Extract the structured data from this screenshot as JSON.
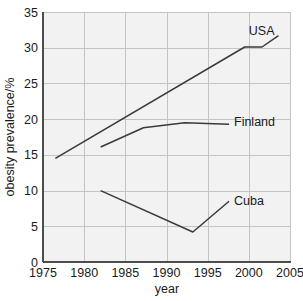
{
  "chart_data": {
    "type": "line",
    "title": "",
    "xlabel": "year",
    "ylabel": "obesity prevalence/%",
    "xlim": [
      1975,
      2005
    ],
    "ylim": [
      0,
      35
    ],
    "xticks": [
      1975,
      1980,
      1985,
      1990,
      1995,
      2000,
      2005
    ],
    "yticks": [
      0,
      5,
      10,
      15,
      20,
      25,
      30,
      35
    ],
    "grid": true,
    "legend_position": "inline-end-of-line",
    "series": [
      {
        "name": "USA",
        "label": "USA",
        "color": "#3a3a3a",
        "points": [
          [
            1976.5,
            14.5
          ],
          [
            1999.5,
            30.1
          ],
          [
            2001.6,
            30.1
          ],
          [
            2003.6,
            31.7
          ]
        ]
      },
      {
        "name": "Finland",
        "label": "Finland",
        "color": "#3a3a3a",
        "points": [
          [
            1982.0,
            16.1
          ],
          [
            1987.2,
            18.8
          ],
          [
            1992.2,
            19.5
          ],
          [
            1997.6,
            19.3
          ]
        ]
      },
      {
        "name": "Cuba",
        "label": "Cuba",
        "color": "#3a3a3a",
        "points": [
          [
            1982.0,
            10.0
          ],
          [
            1993.2,
            4.2
          ],
          [
            1997.6,
            8.5
          ]
        ]
      }
    ],
    "annotations": [
      {
        "text": "USA",
        "x": 2000.0,
        "y": 32.3
      },
      {
        "text": "Finland",
        "x": 1998.2,
        "y": 19.6
      },
      {
        "text": "Cuba",
        "x": 1998.2,
        "y": 8.6
      }
    ]
  },
  "axes": {
    "x_tick_labels": [
      "1975",
      "1980",
      "1985",
      "1990",
      "1995",
      "2000",
      "2005"
    ],
    "y_tick_labels": [
      "0",
      "5",
      "10",
      "15",
      "20",
      "25",
      "30",
      "35"
    ],
    "x_axis_title": "year",
    "y_axis_title": "obesity prevalence/%"
  },
  "colors": {
    "plot_background": "#f2f2f2",
    "page_background": "#ffffff",
    "grid": "#c4c4c4",
    "axis": "#4d4d4d",
    "line": "#3a3a3a",
    "text": "#1a1a1a"
  }
}
